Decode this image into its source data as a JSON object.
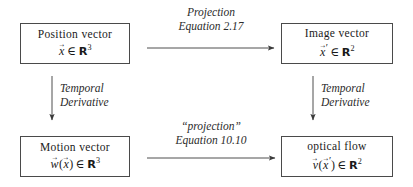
{
  "diagram": {
    "nodes": {
      "position_vector": {
        "title": "Position vector",
        "symbol": "x",
        "set": "R",
        "dimension": "3",
        "formula_text": "x⃗ ∈ ℝ³"
      },
      "image_vector": {
        "title": "Image vector",
        "symbol": "x",
        "prime": "′",
        "set": "R",
        "dimension": "2",
        "formula_text": "x⃗′ ∈ ℝ²"
      },
      "motion_vector": {
        "title": "Motion vector",
        "symbol": "w",
        "argument": "x",
        "set": "R",
        "dimension": "3",
        "formula_text": "w⃗(x⃗) ∈ ℝ³"
      },
      "optical_flow": {
        "title": "optical flow",
        "symbol": "v",
        "argument": "x",
        "argument_prime": "′",
        "set": "R",
        "dimension": "2",
        "formula_text": "v⃗(x⃗′) ∈ ℝ²"
      }
    },
    "edges": {
      "top_horizontal": {
        "line1": "Projection",
        "line2": "Equation 2.17",
        "direction": "right"
      },
      "bottom_horizontal": {
        "line1": "“projection”",
        "line2": "Equation 10.10",
        "direction": "right"
      },
      "left_vertical": {
        "line1": "Temporal",
        "line2": "Derivative",
        "direction": "down"
      },
      "right_vertical": {
        "line1": "Temporal",
        "line2": "Derivative",
        "direction": "down"
      }
    },
    "symbols": {
      "element_of": "∈",
      "open_paren": "(",
      "close_paren": ")"
    },
    "colors": {
      "background": "#ffffff",
      "box_border": "#4a4a4a",
      "text": "#1a1a1a",
      "arrow": "#3a3a3a"
    }
  }
}
